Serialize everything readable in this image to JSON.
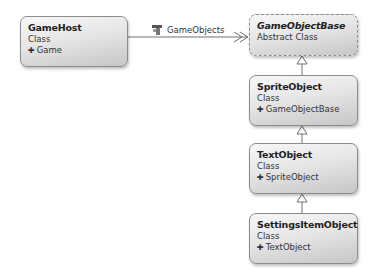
{
  "diagram": {
    "type": "class-diagram",
    "classes": [
      {
        "id": "gamehost",
        "name": "GameHost",
        "kind": "Class",
        "base": "Game",
        "abstract": false
      },
      {
        "id": "gameobjectbase",
        "name": "GameObjectBase",
        "kind": "Abstract Class",
        "base": null,
        "abstract": true
      },
      {
        "id": "spriteobject",
        "name": "SpriteObject",
        "kind": "Class",
        "base": "GameObjectBase",
        "abstract": false
      },
      {
        "id": "textobject",
        "name": "TextObject",
        "kind": "Class",
        "base": "SpriteObject",
        "abstract": false
      },
      {
        "id": "settingsitemobject",
        "name": "SettingsItemObject",
        "kind": "Class",
        "base": "TextObject",
        "abstract": false
      }
    ],
    "associations": [
      {
        "from": "GameHost",
        "to": "GameObjectBase",
        "label": "GameObjects",
        "icon": "property-icon",
        "multiplicity": "collection"
      }
    ],
    "inheritance": [
      {
        "child": "SpriteObject",
        "parent": "GameObjectBase"
      },
      {
        "child": "TextObject",
        "parent": "SpriteObject"
      },
      {
        "child": "SettingsItemObject",
        "parent": "TextObject"
      }
    ],
    "base_arrow_glyph": "✚",
    "colors": {
      "border": "#8c8c8c",
      "line": "#707070",
      "text": "#1e1e1e"
    }
  }
}
